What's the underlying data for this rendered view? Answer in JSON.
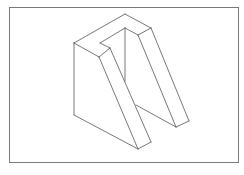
{
  "figure": {
    "border_color": "#7a7a7a",
    "line_color": "#555555",
    "background": "#ffffff",
    "shape": {
      "outline": [
        [
          74,
          43
        ],
        [
          125,
          14
        ],
        [
          151,
          28
        ],
        [
          189,
          121
        ],
        [
          176,
          127
        ],
        [
          137,
          106
        ]
      ],
      "edges": [
        {
          "name": "top-left-outer",
          "points": [
            [
              74,
              43
            ],
            [
              125,
              14
            ]
          ]
        },
        {
          "name": "top-right-outer",
          "points": [
            [
              125,
              14
            ],
            [
              151,
              28
            ]
          ]
        },
        {
          "name": "right-top-front",
          "points": [
            [
              151,
              28
            ],
            [
              138,
              35
            ]
          ]
        },
        {
          "name": "inner-slot-right",
          "points": [
            [
              138,
              35
            ],
            [
              125,
              28
            ]
          ]
        },
        {
          "name": "inner-slot-back",
          "points": [
            [
              125,
              28
            ],
            [
              100,
              43
            ]
          ]
        },
        {
          "name": "inner-slot-left",
          "points": [
            [
              100,
              43
            ],
            [
              110,
              48
            ]
          ]
        },
        {
          "name": "left-top-front",
          "points": [
            [
              110,
              48
            ],
            [
              99,
              57
            ]
          ]
        },
        {
          "name": "left-top-side",
          "points": [
            [
              99,
              57
            ],
            [
              74,
              43
            ]
          ]
        },
        {
          "name": "left-outer-vertical",
          "points": [
            [
              74,
              43
            ],
            [
              74,
              115
            ]
          ]
        },
        {
          "name": "left-bottom",
          "points": [
            [
              74,
              115
            ],
            [
              138,
              149
            ]
          ]
        },
        {
          "name": "left-leg-front-outer",
          "points": [
            [
              99,
              57
            ],
            [
              138,
              149
            ]
          ]
        },
        {
          "name": "left-leg-front-inner",
          "points": [
            [
              110,
              48
            ],
            [
              151,
              142
            ]
          ]
        },
        {
          "name": "left-leg-bottom-end",
          "points": [
            [
              138,
              149
            ],
            [
              151,
              142
            ]
          ]
        },
        {
          "name": "inner-vertical",
          "points": [
            [
              125,
              28
            ],
            [
              125,
              81
            ]
          ]
        },
        {
          "name": "right-leg-front-inner",
          "points": [
            [
              138,
              35
            ],
            [
              176,
              127
            ]
          ]
        },
        {
          "name": "right-leg-front-outer",
          "points": [
            [
              151,
              28
            ],
            [
              189,
              121
            ]
          ]
        },
        {
          "name": "right-leg-bottom-end",
          "points": [
            [
              176,
              127
            ],
            [
              189,
              121
            ]
          ]
        },
        {
          "name": "right-leg-bottom-inner",
          "points": [
            [
              136,
              105
            ],
            [
              176,
              127
            ]
          ]
        }
      ]
    }
  }
}
